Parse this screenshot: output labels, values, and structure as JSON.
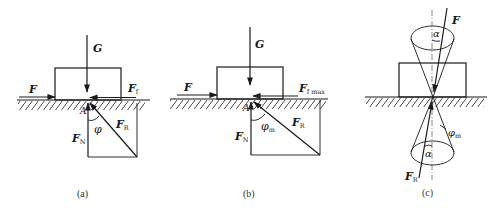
{
  "figure": {
    "panels": [
      {
        "id": "a",
        "caption": "(a)",
        "labels": {
          "gravity": "G",
          "applied_force": "F",
          "friction_main": "F",
          "friction_sub": "f",
          "normal_main": "F",
          "normal_sub": "N",
          "resultant_main": "F",
          "resultant_sub": "R",
          "angle": "φ",
          "point": "A"
        }
      },
      {
        "id": "b",
        "caption": "(b)",
        "labels": {
          "gravity": "G",
          "applied_force": "F",
          "friction_main": "F",
          "friction_sub": "f max",
          "normal_main": "F",
          "normal_sub": "N",
          "resultant_main": "F",
          "resultant_sub": "R",
          "angle_main": "φ",
          "angle_sub": "m",
          "point": "A"
        }
      },
      {
        "id": "c",
        "caption": "(c)",
        "labels": {
          "force": "F",
          "resultant_main": "F",
          "resultant_sub": "R",
          "alpha_top": "α",
          "alpha_bottom": "α",
          "angle_main": "φ",
          "angle_sub": "m"
        }
      }
    ],
    "colors": {
      "ink": "#1a1a1a",
      "background": "#ffffff"
    }
  }
}
